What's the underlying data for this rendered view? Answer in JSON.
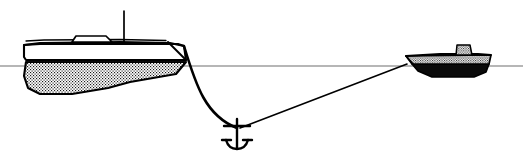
{
  "illustration": {
    "title": "Two vessels moored to a single anchor",
    "subject": "anchoring-diagram",
    "canvas": {
      "width": 523,
      "height": 156,
      "background": "#ffffff"
    }
  },
  "colors": {
    "ink": "#000000",
    "waterline": "#6e6e6e",
    "hull_fill_white": "#ffffff",
    "hull_fill_stipple_base": "#ffffff",
    "stipple_dot": "#1a1a1a",
    "solid_black": "#0a0a0a"
  },
  "waterline": {
    "label": "waterline",
    "y": 66,
    "x_start": 0,
    "x_end": 523,
    "stroke": "#6e6e6e",
    "stroke_width": 1.1
  },
  "left_vessel": {
    "name": "large-boat",
    "position_label": "left",
    "bow_x": 185,
    "stern_x": 20,
    "deck_y": 43,
    "keel_y": 95,
    "hull_topsides_fill": "#ffffff",
    "hull_underwater_fill": "stipple",
    "mast": {
      "x": 124,
      "top_y": 11,
      "bottom_y": 44,
      "stroke_width": 1.6
    },
    "cabin": {
      "x_start": 70,
      "x_end": 112,
      "top_y": 36,
      "bottom_y": 44
    },
    "rode_attachment": {
      "x": 184,
      "y": 46
    }
  },
  "right_vessel": {
    "name": "small-boat",
    "position_label": "right",
    "bow_x": 406,
    "stern_x": 492,
    "deck_y": 56,
    "keel_y": 77,
    "hull_topsides_fill": "stipple",
    "hull_bottom_fill": "#0a0a0a",
    "deckhouse": {
      "x_start": 455,
      "x_end": 472,
      "top_y": 44,
      "bottom_y": 56
    },
    "rode_attachment": {
      "x": 407,
      "y": 64
    }
  },
  "anchor": {
    "name": "admiralty-anchor",
    "x": 237,
    "y": 130,
    "shank_top_y": 118,
    "shank_bottom_y": 148,
    "stock_half_width": 13,
    "stock_y": 126,
    "arm_half_width": 11,
    "stroke_width": 2.2
  },
  "rodes": [
    {
      "name": "left-rode-catenary",
      "shape": "curved-catenary",
      "from_label": "large-boat-bow",
      "to_label": "anchor",
      "from": {
        "x": 184,
        "y": 46
      },
      "to": {
        "x": 237,
        "y": 128
      },
      "control_1": {
        "x": 196,
        "y": 86
      },
      "control_2": {
        "x": 206,
        "y": 116
      },
      "stroke_width": 2.6
    },
    {
      "name": "right-rode-taut",
      "shape": "straight-taut",
      "from_label": "small-boat-bow",
      "to_label": "anchor",
      "from": {
        "x": 407,
        "y": 64
      },
      "to": {
        "x": 240,
        "y": 128
      },
      "stroke_width": 1.6
    }
  ]
}
